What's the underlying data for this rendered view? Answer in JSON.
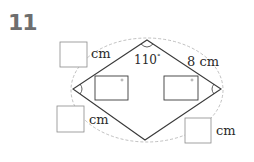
{
  "question": {
    "number": "11"
  },
  "diagram": {
    "shape": "rhombus",
    "vertices": {
      "top": [
        147,
        40
      ],
      "right": [
        221,
        89
      ],
      "bottom": [
        145,
        140
      ],
      "left": [
        73,
        89
      ]
    },
    "angle_top_label": "110",
    "angle_degree_symbol": "°",
    "given_side_label": "8 cm",
    "unit_label": "cm",
    "answer_boxes": [
      {
        "id": "side-top-left",
        "unit": "cm"
      },
      {
        "id": "side-bottom-left",
        "unit": "cm"
      },
      {
        "id": "side-bottom-right",
        "unit": "cm"
      },
      {
        "id": "angle-left",
        "unit": "°"
      },
      {
        "id": "angle-right",
        "unit": "°"
      }
    ],
    "colors": {
      "line": "#3a3a3a",
      "box": "#8a8a8a",
      "dashed": "#b0b0b0",
      "number": "#6e6e6e"
    }
  }
}
